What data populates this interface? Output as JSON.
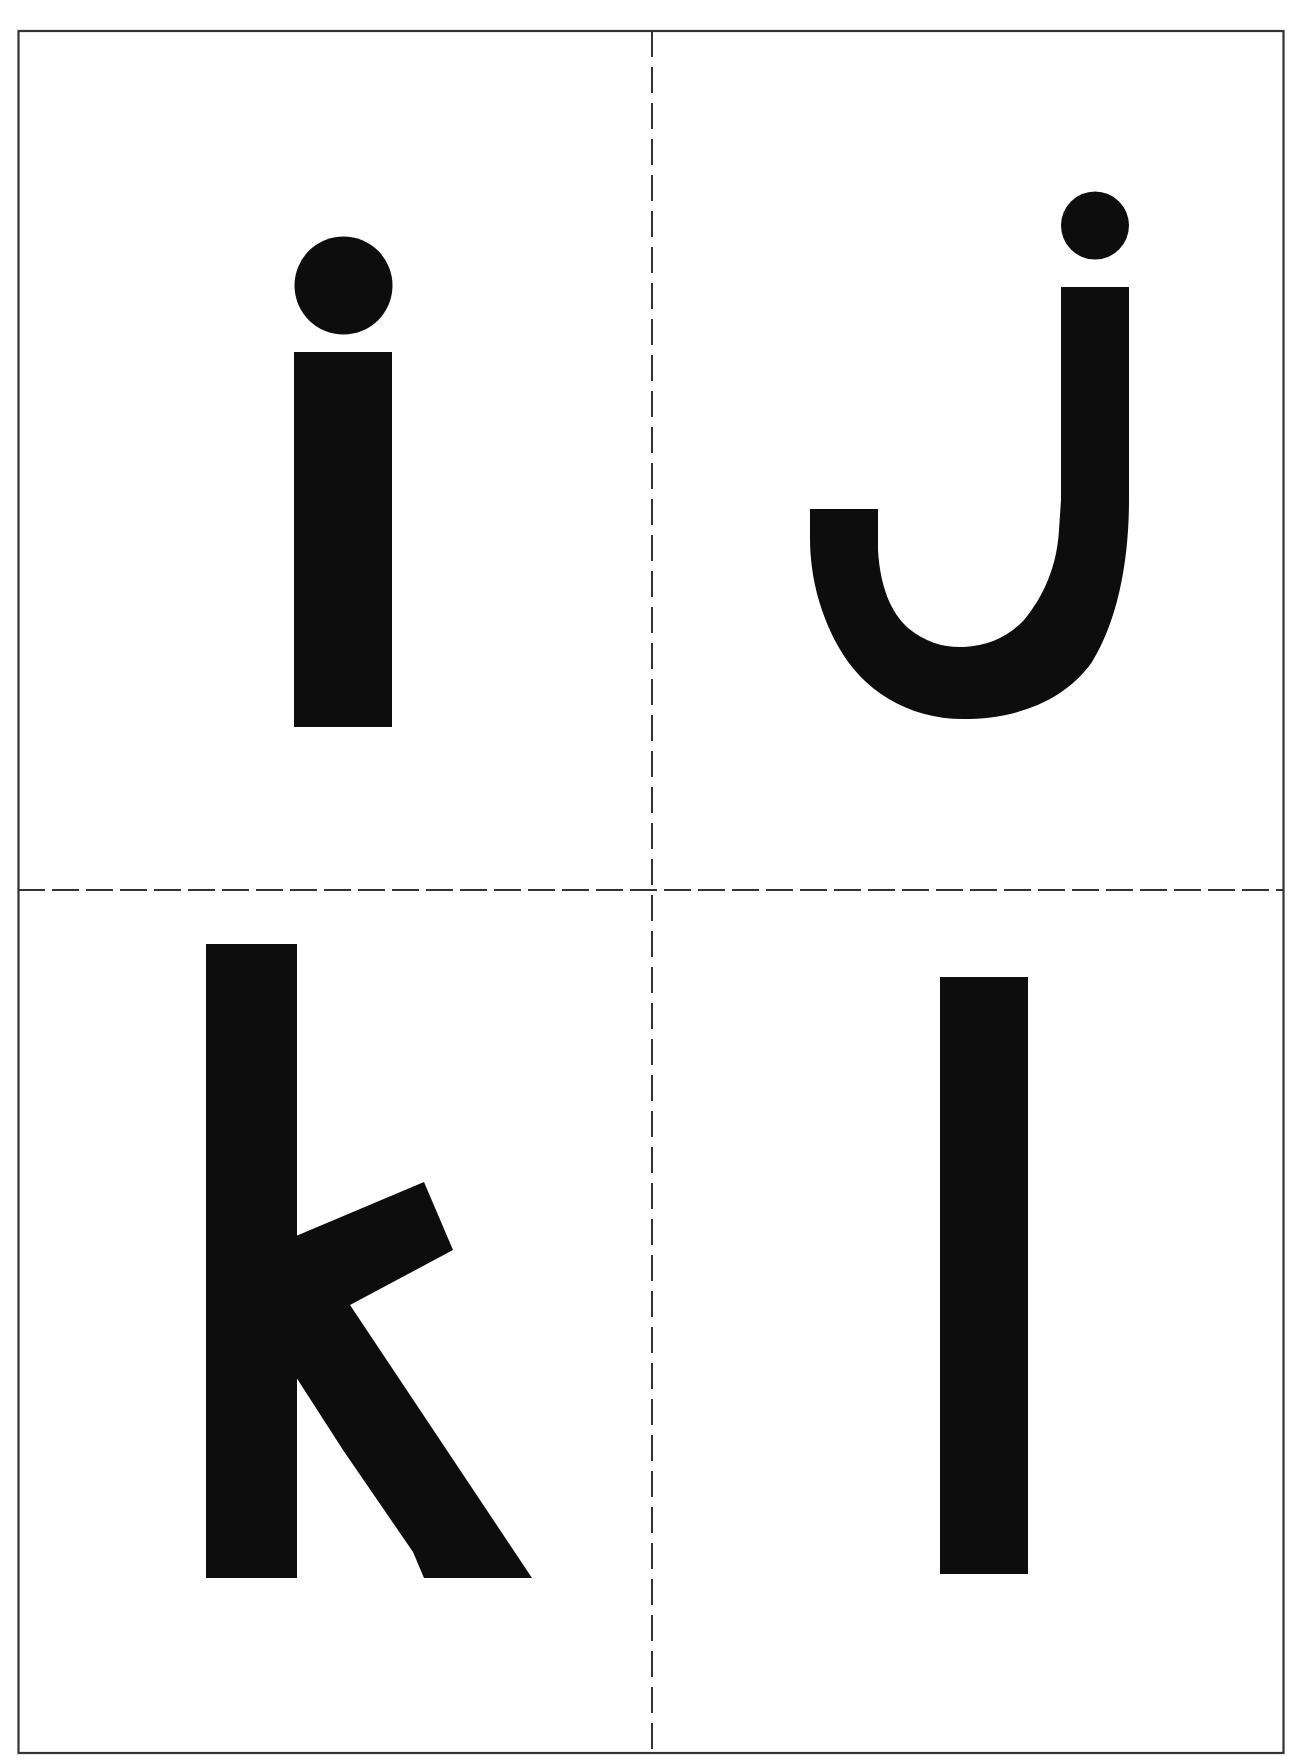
{
  "sheet": {
    "title": "Lowercase letter flashcards i j k l",
    "border_color": "#333333",
    "glyph_color": "#0d0d0d",
    "background": "#ffffff",
    "layout": "2x2 grid with dashed cut lines"
  },
  "cards": [
    {
      "position": "top-left",
      "letter": "i"
    },
    {
      "position": "top-right",
      "letter": "j"
    },
    {
      "position": "bottom-left",
      "letter": "k"
    },
    {
      "position": "bottom-right",
      "letter": "l"
    }
  ]
}
